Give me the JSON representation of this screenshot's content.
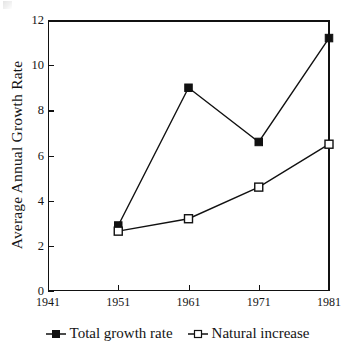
{
  "chart_data": {
    "type": "line",
    "title": "",
    "subtitle": "",
    "xlabel": "",
    "ylabel": "Average Annual Growth Rate",
    "x": [
      1941,
      1951,
      1961,
      1971,
      1981
    ],
    "xtick_labels": [
      "1941",
      "1951",
      "1961",
      "1971",
      "1981"
    ],
    "ytick_labels": [
      "0",
      "2",
      "4",
      "6",
      "8",
      "10",
      "12"
    ],
    "ytick_values": [
      0,
      2,
      4,
      6,
      8,
      10,
      12
    ],
    "xlim": [
      1941,
      1981
    ],
    "ylim": [
      0,
      12
    ],
    "grid": false,
    "legend_position": "bottom",
    "series": [
      {
        "name": "Total growth rate",
        "marker": "filled-square",
        "color": "#111111",
        "x": [
          1951,
          1961,
          1971,
          1981
        ],
        "values": [
          2.9,
          9.0,
          6.6,
          11.2
        ]
      },
      {
        "name": "Natural increase",
        "marker": "open-square",
        "color": "#111111",
        "x": [
          1951,
          1961,
          1971,
          1981
        ],
        "values": [
          2.65,
          3.2,
          4.6,
          6.5
        ]
      }
    ]
  },
  "axis": {
    "y_title": "Average Annual Growth Rate",
    "y_ticks": [
      "12",
      "10",
      "8",
      "6",
      "4",
      "2",
      "0"
    ],
    "x_ticks": [
      "1941",
      "1951",
      "1961",
      "1971",
      "1981"
    ]
  },
  "legend": {
    "entries": [
      {
        "label": "Total growth rate",
        "marker": "filled-square"
      },
      {
        "label": "Natural increase",
        "marker": "open-square"
      }
    ]
  }
}
